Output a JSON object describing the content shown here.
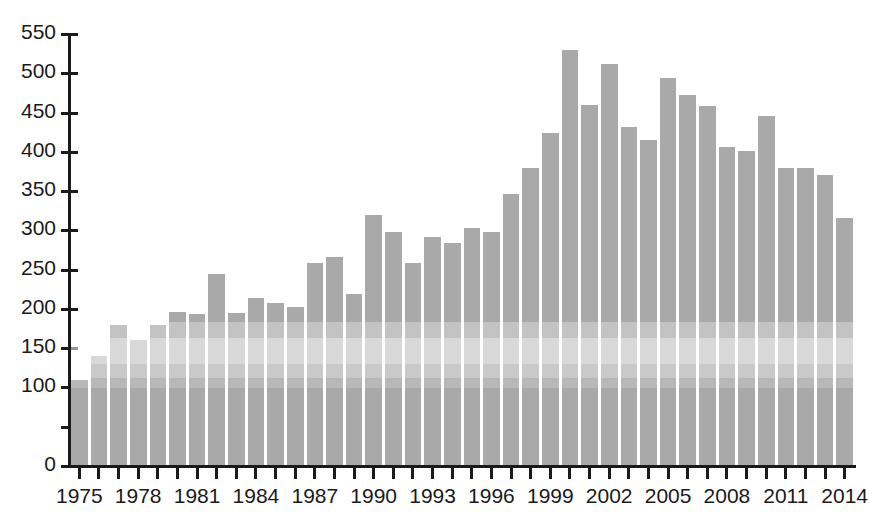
{
  "chart_data": {
    "type": "bar",
    "title": "",
    "subtitle": "",
    "xlabel": "",
    "ylabel": "",
    "xlim": [
      1974.5,
      2014.5
    ],
    "ylim": [
      0,
      550
    ],
    "grid": false,
    "legend": null,
    "bar_color": "#a9a9a9",
    "axis_color": "#1a1a1a",
    "background_color": "#ffffff",
    "y_ticks": [
      0,
      50,
      100,
      150,
      200,
      250,
      300,
      350,
      400,
      450,
      500,
      550
    ],
    "y_tick_labels": [
      "0",
      "50",
      "100",
      "150",
      "200",
      "250",
      "300",
      "350",
      "400",
      "450",
      "500",
      "550"
    ],
    "y_tick_labels_shown": [
      "0",
      "100",
      "150",
      "200",
      "250",
      "300",
      "350",
      "400",
      "450",
      "500",
      "550"
    ],
    "x_tick_labels": [
      "1975",
      "1978",
      "1981",
      "1984",
      "1987",
      "1990",
      "1993",
      "1996",
      "1999",
      "2002",
      "2005",
      "2008",
      "2011",
      "2014"
    ],
    "x_label_interval": 3,
    "categories": [
      "1975",
      "1976",
      "1977",
      "1978",
      "1979",
      "1980",
      "1981",
      "1982",
      "1983",
      "1984",
      "1985",
      "1986",
      "1987",
      "1988",
      "1989",
      "1990",
      "1991",
      "1992",
      "1993",
      "1994",
      "1995",
      "1996",
      "1997",
      "1998",
      "1999",
      "2000",
      "2001",
      "2002",
      "2003",
      "2004",
      "2005",
      "2006",
      "2007",
      "2008",
      "2009",
      "2010",
      "2011",
      "2012",
      "2013",
      "2014"
    ],
    "values": [
      110,
      140,
      180,
      160,
      180,
      196,
      193,
      245,
      195,
      214,
      208,
      202,
      259,
      266,
      219,
      319,
      298,
      259,
      292,
      284,
      303,
      298,
      346,
      379,
      424,
      529,
      459,
      512,
      431,
      415,
      494,
      472,
      458,
      406,
      401,
      446,
      380,
      379,
      370,
      316
    ],
    "series": [
      {
        "name": "value",
        "values": [
          110,
          140,
          180,
          160,
          180,
          196,
          193,
          245,
          195,
          214,
          208,
          202,
          259,
          266,
          219,
          319,
          298,
          259,
          292,
          284,
          303,
          298,
          346,
          379,
          424,
          529,
          459,
          512,
          431,
          415,
          494,
          472,
          458,
          406,
          401,
          446,
          380,
          379,
          370,
          316
        ]
      }
    ],
    "annotations": [],
    "max_value": 529,
    "max_value_category": "2000",
    "min_value": 110,
    "min_value_category": "1975"
  }
}
